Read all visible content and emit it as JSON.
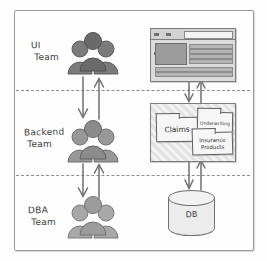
{
  "diagram": {
    "style": "hand-drawn sketch",
    "colors": {
      "frame": "#9a9a9a",
      "lane_separator": "#8d8d8d",
      "arrow": "#6e6e6e",
      "people_dark": "#6f6f6f",
      "people_mid": "#8d8d8d",
      "people_light": "#a5a5a5",
      "ink": "#3a3a3a"
    }
  },
  "lanes": [
    {
      "id": "ui",
      "label_line1": "UI",
      "label_line2": "Team",
      "icon": "people-group-icon",
      "artifact": "browser-window"
    },
    {
      "id": "backend",
      "label_line1": "Backend",
      "label_line2": "Team",
      "icon": "people-group-icon",
      "artifact": "services-box"
    },
    {
      "id": "dba",
      "label_line1": "DBA",
      "label_line2": "Team",
      "icon": "people-group-icon",
      "artifact": "database-cylinder"
    }
  ],
  "browser": {
    "name": "browser-window",
    "url_bar_value": "",
    "dot_count": 3,
    "content_lines": 6
  },
  "services": {
    "name": "services-box",
    "cards": [
      {
        "id": "claims",
        "label": "Claims"
      },
      {
        "id": "underwriting",
        "label": "Underwriting"
      },
      {
        "id": "insurance-products",
        "label_line1": "Insurance",
        "label_line2": "Products"
      }
    ]
  },
  "database": {
    "name": "database-cylinder",
    "label": "DB"
  },
  "arrows": {
    "description": "Bidirectional vertical arrow pairs linking each lane to the next",
    "pairs": [
      {
        "id": "ui-backend-left",
        "direction": "down"
      },
      {
        "id": "ui-backend-right",
        "direction": "up"
      },
      {
        "id": "backend-dba-left",
        "direction": "down"
      },
      {
        "id": "backend-dba-right",
        "direction": "up"
      },
      {
        "id": "browser-services-left",
        "direction": "down"
      },
      {
        "id": "browser-services-right",
        "direction": "up"
      },
      {
        "id": "services-db-left",
        "direction": "down"
      },
      {
        "id": "services-db-right",
        "direction": "up"
      }
    ]
  }
}
